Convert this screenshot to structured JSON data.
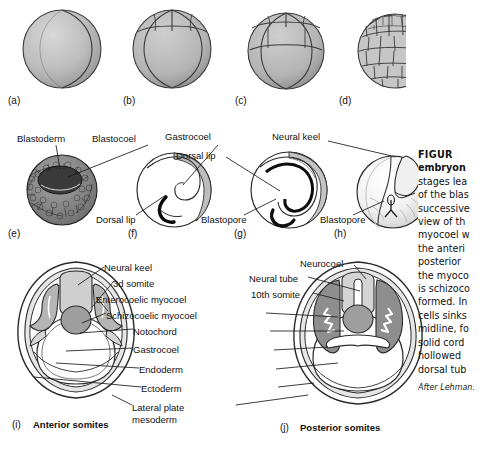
{
  "figure": {
    "panels_top": [
      {
        "id": "(a)",
        "name": "one-cell-stage"
      },
      {
        "id": "(b)",
        "name": "early-cleavage"
      },
      {
        "id": "(c)",
        "name": "eight-cell-stage"
      },
      {
        "id": "(d)",
        "name": "blastula-surface"
      }
    ],
    "panels_middle": [
      {
        "id": "(e)",
        "name": "blastula-section"
      },
      {
        "id": "(f)",
        "name": "early-gastrula"
      },
      {
        "id": "(g)",
        "name": "late-gastrula"
      },
      {
        "id": "(h)",
        "name": "neurula-external"
      }
    ],
    "panels_bottom": [
      {
        "id": "(i)",
        "caption": "Anterior somites"
      },
      {
        "id": "(j)",
        "caption": "Posterior somites"
      }
    ],
    "labels_middle": {
      "blastoderm": "Blastoderm",
      "blastocoel": "Blastocoel",
      "dorsal_lip_f": "Dorsal lip",
      "gastrocoel": "Gastrocoel",
      "dorsal_lip_g": "Dorsal lip",
      "blastopore_g": "Blastopore",
      "neural_keel": "Neural keel",
      "blastopore_h": "Blastopore"
    },
    "labels_bottom_left": [
      "Neural keel",
      "3d somite",
      "Enterocoelic myocoel",
      "Schizocoelic myocoel",
      "Notochord",
      "Gastrocoel",
      "Endoderm",
      "Ectoderm",
      "Lateral plate",
      "mesoderm"
    ],
    "labels_bottom_right": [
      "Neurocoel",
      "Neural tube",
      "10th somite"
    ],
    "caption": {
      "figure_word": "FIGUR",
      "title_line": "embryon",
      "body": [
        "stages lea",
        "of the blas",
        "successive",
        "view of th",
        "myocoel w",
        "the anteri",
        "posterior",
        "the myoco",
        "is schizoco",
        "formed. In",
        "cells sinks",
        "midline, fo",
        "solid cord",
        "hollowed",
        "dorsal tub"
      ],
      "source": "After Lehman."
    },
    "colors": {
      "ink": "#111111",
      "fill_light": "#e2e2e2",
      "fill_mid": "#c9c9c9",
      "fill_dark": "#9d9d9d",
      "fill_darker": "#7a7a7a",
      "white": "#ffffff"
    }
  }
}
